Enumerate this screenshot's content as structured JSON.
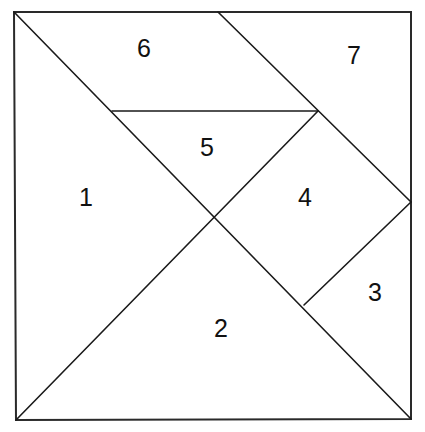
{
  "diagram": {
    "piece_count": 7,
    "pieces": [
      {
        "id": "1",
        "label": "1",
        "shape": "large triangle"
      },
      {
        "id": "2",
        "label": "2",
        "shape": "large triangle"
      },
      {
        "id": "3",
        "label": "3",
        "shape": "small triangle"
      },
      {
        "id": "4",
        "label": "4",
        "shape": "square"
      },
      {
        "id": "5",
        "label": "5",
        "shape": "small triangle"
      },
      {
        "id": "6",
        "label": "6",
        "shape": "parallelogram"
      },
      {
        "id": "7",
        "label": "7",
        "shape": "medium triangle"
      }
    ],
    "colors": {
      "stroke": "#1a1a1a",
      "background": "#ffffff",
      "text": "#111111"
    }
  }
}
